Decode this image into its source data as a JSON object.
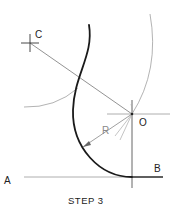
{
  "diagram": {
    "type": "geometric-construction",
    "labels": {
      "point_c": "C",
      "point_o": "O",
      "point_a": "A",
      "point_b": "B",
      "radius": "R"
    },
    "caption": "STEP 3",
    "colors": {
      "heavy_line": "#1a1a1a",
      "construction_line": "#9a9a9a",
      "label": "#222222",
      "background": "#ffffff"
    }
  }
}
